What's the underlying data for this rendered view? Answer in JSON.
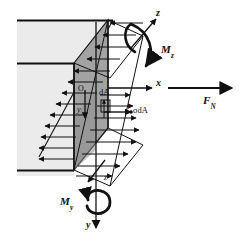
{
  "figure": {
    "background_color": "#ffffff"
  },
  "colors": {
    "beam_body": "#ebebeb",
    "section_face": "#a3a3a3",
    "section_face_dark": "#8f8f8f",
    "stroke": "#111111",
    "label": "#111111"
  },
  "axes": [
    {
      "key": "z_top",
      "label": "z",
      "sub": "",
      "direction": "up-right"
    },
    {
      "key": "x_right",
      "label": "x",
      "sub": "",
      "direction": "right"
    },
    {
      "key": "y_bottom",
      "label": "y",
      "sub": "",
      "direction": "down"
    },
    {
      "key": "z_lower",
      "label": "z",
      "sub": "",
      "direction": "down-left"
    },
    {
      "key": "y_inner",
      "label": "y",
      "sub": "",
      "direction": "down"
    }
  ],
  "labels": {
    "origin": "O",
    "z_top": "z",
    "x_axis": "x",
    "y_axis": "y",
    "y_inner": "y",
    "z_lower": "z",
    "element_area": "dA",
    "stress_force": "σdA",
    "normal_force_main": "F",
    "normal_force_sub": "N",
    "moment_z_main": "M",
    "moment_z_sub": "z",
    "moment_y_main": "M",
    "moment_y_sub": "y"
  },
  "annotations": [
    {
      "name": "normal-force",
      "text": "F",
      "subscript": "N",
      "meaning": "resultant normal force along x"
    },
    {
      "name": "moment-z",
      "text": "M",
      "subscript": "z",
      "meaning": "bending moment about z axis"
    },
    {
      "name": "moment-y",
      "text": "M",
      "subscript": "y",
      "meaning": "bending moment about y axis"
    },
    {
      "name": "stress-on-area",
      "text": "σdA",
      "subscript": "",
      "meaning": "elemental stress force on area dA"
    },
    {
      "name": "area-element",
      "text": "dA",
      "subscript": "",
      "meaning": "differential area element"
    },
    {
      "name": "origin",
      "text": "O",
      "subscript": "",
      "meaning": "centroid / origin of section axes"
    }
  ],
  "stress_distribution": {
    "type": "linear-bending",
    "upper_region": "compression-arrows-pointing-left",
    "lower_region": "tension-arrows-pointing-right",
    "neutral_axis_note": "zero stress at the inclined neutral line"
  }
}
